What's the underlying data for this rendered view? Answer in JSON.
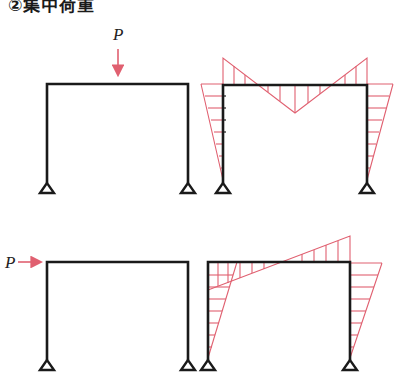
{
  "title": "②集中荷重",
  "colors": {
    "frame": "#1a1a1a",
    "diagram": "#e06070",
    "load_arrow": "#e06070"
  },
  "diagrams": [
    {
      "id": "top-left",
      "description": "Portal frame with vertical concentrated load P at beam midspan",
      "load": {
        "label": "P",
        "direction": "down",
        "label_x": 118,
        "label_y": 38
      },
      "frame": {
        "left_x": 47,
        "right_x": 188,
        "beam_y": 84,
        "base_y": 183
      }
    },
    {
      "id": "top-right",
      "description": "Bending moment diagram for vertical load P",
      "frame": {
        "left_x": 223,
        "right_x": 367,
        "beam_y": 85,
        "base_y": 183
      }
    },
    {
      "id": "bottom-left",
      "description": "Portal frame with horizontal concentrated load P at beam level",
      "load": {
        "label": "P",
        "direction": "right",
        "label_x": 7,
        "label_y": 270
      },
      "frame": {
        "left_x": 47,
        "right_x": 188,
        "beam_y": 262,
        "base_y": 360
      }
    },
    {
      "id": "bottom-right",
      "description": "Bending moment diagram for horizontal load P",
      "frame": {
        "left_x": 208,
        "right_x": 350,
        "beam_y": 262,
        "base_y": 360
      }
    }
  ]
}
